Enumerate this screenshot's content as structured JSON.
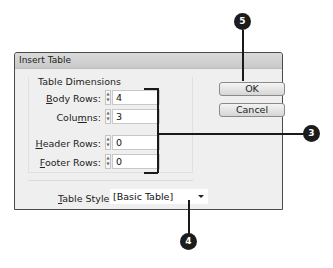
{
  "dialog": {
    "title": "Insert Table",
    "group_title": "Table Dimensions",
    "fields": [
      {
        "label_pre": "",
        "label_u": "B",
        "label_post": "ody Rows:",
        "value": "4"
      },
      {
        "label_pre": "Colu",
        "label_u": "m",
        "label_post": "ns:",
        "value": "3"
      },
      {
        "label_pre": "",
        "label_u": "H",
        "label_post": "eader Rows:",
        "value": "0"
      },
      {
        "label_pre": "",
        "label_u": "F",
        "label_post": "ooter Rows:",
        "value": "0"
      }
    ],
    "table_style": {
      "label_u": "T",
      "label_post": "able Style:",
      "value": "[Basic Table]"
    },
    "buttons": {
      "ok": "OK",
      "cancel": "Cancel"
    }
  },
  "callouts": {
    "c5": "5",
    "c3": "3",
    "c4": "4"
  }
}
